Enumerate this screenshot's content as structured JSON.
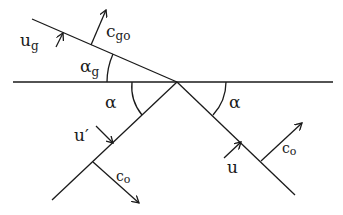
{
  "diagram": {
    "labels": {
      "u_g": "u",
      "u_g_sub": "g",
      "c_go": "c",
      "c_go_sub": "go",
      "alpha_g": "α",
      "alpha_g_sub": "g",
      "alpha_left": "α",
      "alpha_right": "α",
      "u_prime": "u′",
      "c_o_left": "c",
      "c_o_left_sub": "o",
      "u": "u",
      "c_o_right": "c",
      "c_o_right_sub": "o"
    },
    "colors": {
      "line": "#1a1a1a",
      "background": "#ffffff"
    }
  }
}
